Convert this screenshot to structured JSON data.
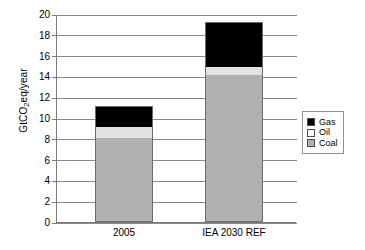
{
  "chart_data": {
    "type": "bar",
    "stacked": true,
    "title": "",
    "xlabel": "",
    "ylabel": "GtCO2eq/year",
    "ylabel_parts": {
      "pre": "GtCO",
      "sub": "2",
      "post": "eq/year"
    },
    "categories": [
      "2005",
      "IEA 2030 REF"
    ],
    "series": [
      {
        "name": "Coal",
        "color": "#b0b0b0",
        "values": [
          8,
          14
        ]
      },
      {
        "name": "Oil",
        "color": "#ffffff",
        "values": [
          1,
          0.8
        ]
      },
      {
        "name": "Gas",
        "color": "#000000",
        "values": [
          2,
          4.2
        ]
      }
    ],
    "stack_order_bottom_to_top": [
      "Coal",
      "Oil",
      "Gas"
    ],
    "totals": [
      11,
      19
    ],
    "ylim": [
      0,
      20
    ],
    "yticks": [
      0,
      2,
      4,
      6,
      8,
      10,
      12,
      14,
      16,
      18,
      20
    ],
    "ytick_labels": [
      "0",
      "2",
      "4",
      "6",
      "8",
      "10",
      "12",
      "14",
      "16",
      "18",
      "20"
    ],
    "grid": true,
    "grid_axis": "y",
    "legend_position": "right",
    "legend_entries": [
      {
        "label": "Gas",
        "color": "#000000"
      },
      {
        "label": "Oil",
        "color": "#ffffff"
      },
      {
        "label": "Coal",
        "color": "#b0b0b0"
      }
    ]
  }
}
